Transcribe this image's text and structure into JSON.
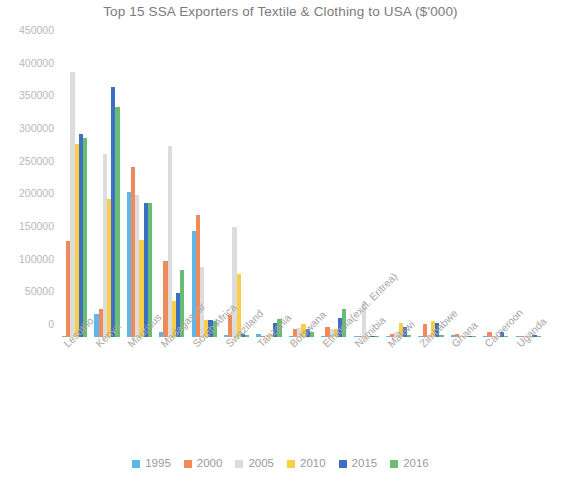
{
  "chart_data": {
    "type": "bar",
    "title": "Top 15 SSA Exporters of Textile & Clothing to USA ($'000)",
    "xlabel": "",
    "ylabel": "",
    "ylim": [
      0,
      450000
    ],
    "ytick_step": 50000,
    "yticks": [
      "450000",
      "400000",
      "350000",
      "300000",
      "250000",
      "200000",
      "150000",
      "100000",
      "50000",
      "0"
    ],
    "grid": false,
    "legend_position": "bottom",
    "categories": [
      "Lesotho",
      "Kenya",
      "Mauritius",
      "Madagascar",
      "South Africa",
      "Swaziland",
      "Tanzania",
      "Botswana",
      "Ethiopia(excl. Eritrea)",
      "Namibia",
      "Malawi",
      "Zimbabwe",
      "Ghana",
      "Cameroon",
      "Uganda"
    ],
    "series": [
      {
        "name": "1995",
        "color": "#5eb7e8",
        "values": [
          2000,
          35000,
          222000,
          8000,
          163000,
          2500,
          4000,
          1500,
          1000,
          1500,
          2000,
          1000,
          3000,
          500,
          300
        ]
      },
      {
        "name": "2000",
        "color": "#ef8a5b",
        "values": [
          147000,
          43000,
          260000,
          116000,
          187000,
          34000,
          2000,
          12000,
          16000,
          1500,
          5000,
          20000,
          4000,
          7000,
          400
        ]
      },
      {
        "name": "2005",
        "color": "#dcdcdc",
        "values": [
          405000,
          280000,
          218000,
          293000,
          107000,
          168000,
          2500,
          14000,
          12000,
          53000,
          7000,
          2500,
          2000,
          1000,
          1500
        ]
      },
      {
        "name": "2010",
        "color": "#f8cf46",
        "values": [
          295000,
          211000,
          148000,
          55000,
          26000,
          97000,
          3500,
          20000,
          12000,
          1000,
          22000,
          24000,
          1500,
          600,
          700
        ]
      },
      {
        "name": "2015",
        "color": "#3f6fc4",
        "values": [
          310000,
          383000,
          205000,
          68000,
          26000,
          4000,
          22000,
          13000,
          29000,
          1000,
          15000,
          21000,
          1500,
          8000,
          3500
        ]
      },
      {
        "name": "2016",
        "color": "#68bd75",
        "values": [
          305000,
          352000,
          205000,
          103000,
          24000,
          2500,
          28000,
          7000,
          43000,
          1000,
          3000,
          3000,
          1200,
          1000,
          1000
        ]
      }
    ]
  },
  "legend": {
    "items": [
      {
        "label": "1995",
        "color": "#5eb7e8"
      },
      {
        "label": "2000",
        "color": "#ef8a5b"
      },
      {
        "label": "2005",
        "color": "#dcdcdc"
      },
      {
        "label": "2010",
        "color": "#f8cf46"
      },
      {
        "label": "2015",
        "color": "#3f6fc4"
      },
      {
        "label": "2016",
        "color": "#68bd75"
      }
    ]
  },
  "colors": {
    "background": "#ffffff",
    "title_text": "#7b7b7b",
    "tick_text": "#b9b9b9",
    "category_text": "#a6a6a6",
    "legend_text": "#9a9a9a"
  }
}
